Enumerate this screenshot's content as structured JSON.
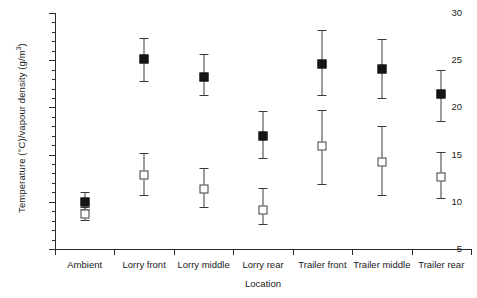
{
  "chart_data": {
    "type": "scatter",
    "title": "",
    "xlabel": "Location",
    "ylabel": "Temperature (°C)/vapour density (g/m³)",
    "ylim": [
      5,
      30
    ],
    "ytick_step": 5,
    "yminor_step": 1,
    "grid": false,
    "legend": "none",
    "categories": [
      "Ambient",
      "Lorry front",
      "Lorry middle",
      "Lorry rear",
      "Trailer front",
      "Trailer middle",
      "Trailer rear"
    ],
    "ytick_labels": [
      "5",
      "10",
      "15",
      "20",
      "25",
      "30"
    ],
    "series": [
      {
        "name": "Temperature (°C)",
        "marker": "filled-square",
        "values": [
          10.0,
          25.1,
          23.2,
          17.0,
          24.6,
          24.1,
          21.4
        ],
        "err_low": [
          9.2,
          22.8,
          21.3,
          14.6,
          21.3,
          21.0,
          18.6
        ],
        "err_high": [
          11.0,
          27.4,
          25.7,
          19.6,
          28.2,
          27.2,
          24.0
        ]
      },
      {
        "name": "Vapour density (g/m³)",
        "marker": "open-square",
        "values": [
          8.7,
          12.8,
          11.4,
          9.1,
          15.9,
          14.2,
          12.6
        ],
        "err_low": [
          8.1,
          10.7,
          9.5,
          7.6,
          11.9,
          10.7,
          10.4
        ],
        "err_high": [
          9.4,
          15.2,
          13.6,
          11.5,
          19.7,
          18.0,
          15.3
        ]
      }
    ],
    "colors": {
      "axis": "#2b2b2b",
      "filled_marker": "#141414",
      "open_marker_border": "#3d3d3d",
      "open_marker_fill": "#ffffff",
      "errorbar": "#3a3a3a",
      "background": "#ffffff"
    }
  }
}
